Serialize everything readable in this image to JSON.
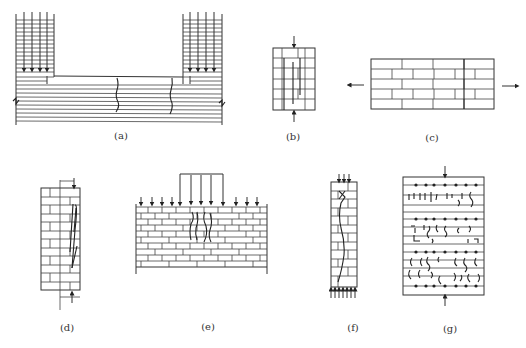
{
  "figure": {
    "panels": [
      {
        "id": "a",
        "caption": "(a)",
        "description": "Masonry wall with two loaded piers above a continuous horizontal-bedded base; vertical cracks in the base between piers"
      },
      {
        "id": "b",
        "caption": "(b)",
        "description": "Small masonry prism under axial compression with vertical splitting cracks"
      },
      {
        "id": "c",
        "caption": "(c)",
        "description": "Masonry panel under horizontal tension (arrows pointing outward)"
      },
      {
        "id": "d",
        "caption": "(d)",
        "description": "Tall masonry column with eccentric load and vertical cracks near loaded edge"
      },
      {
        "id": "e",
        "caption": "(e)",
        "description": "Masonry wall under uniform load with concentrated local load; vertical cracks under the local load"
      },
      {
        "id": "f",
        "caption": "(f)",
        "description": "Slender masonry column under compression with a wavy crack along height"
      },
      {
        "id": "g",
        "caption": "(g)",
        "description": "Masonry specimen with bed joint reinforcement (dots) under compression; distributed cracks between reinforced joints"
      }
    ]
  }
}
